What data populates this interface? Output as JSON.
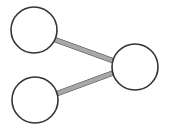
{
  "figure": {
    "kind": "node-link-diagram",
    "title": "",
    "background_color": "#ffffff",
    "width": 171,
    "height": 133
  },
  "style": {
    "node_fill": "#ffffff",
    "node_stroke": "#333333",
    "node_stroke_width": 1.6,
    "node_radius": 23,
    "edge_color": "#a8a8a8",
    "edge_outline_color": "#4a4a4a",
    "edge_width": 4.2,
    "edge_outline_width": 5.4
  },
  "graph": {
    "node_count": 3,
    "edge_count": 2,
    "nodes": [
      {
        "id": "n1",
        "label": "",
        "cx": 34,
        "cy": 30,
        "r": 23
      },
      {
        "id": "n2",
        "label": "",
        "cx": 35,
        "cy": 100,
        "r": 23
      },
      {
        "id": "n3",
        "label": "",
        "cx": 135,
        "cy": 67,
        "r": 23
      }
    ],
    "edges": [
      {
        "id": "e1",
        "source": "n1",
        "target": "n3",
        "x1": 54.5,
        "y1": 39.5,
        "x2": 116.5,
        "y2": 62.0
      },
      {
        "id": "e2",
        "source": "n2",
        "target": "n3",
        "x1": 56.0,
        "y1": 94.0,
        "x2": 117.0,
        "y2": 71.5
      }
    ]
  }
}
